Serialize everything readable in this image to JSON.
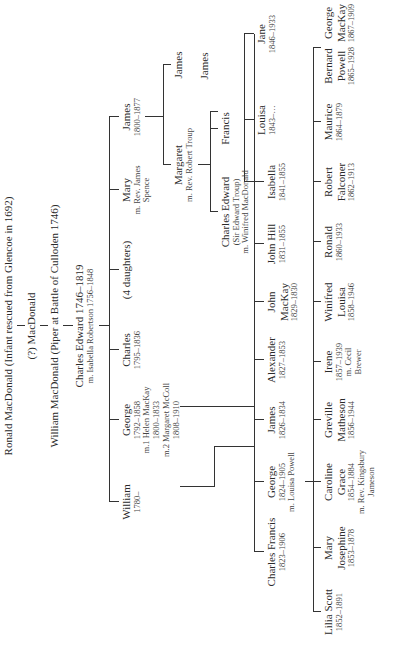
{
  "gen1": [
    {
      "name": "Ronald MacDonald (Infant rescued from Glencoe in 1692)"
    },
    {
      "name": "(?) MacDonald"
    },
    {
      "name": "William MacDonald (Piper at Battle of Culloden 1746)"
    },
    {
      "name": "Charles Edward 1746–1819",
      "spouse": "m. Isabella Robertson 1756–1848"
    }
  ],
  "children_of_charles_edward": [
    {
      "name": "William",
      "dates": "1780–"
    },
    {
      "name": "George",
      "dates": "1792–1858",
      "spouse1": "m.1 Helen MacKay",
      "spouse1_dates": "1800–1833",
      "spouse2": "m.2 Margaret McColl",
      "spouse2_dates": "1808–1910"
    },
    {
      "name": "Charles",
      "dates": "1795–1836"
    },
    {
      "name": "(4 daughters)"
    },
    {
      "name": "Mary",
      "spouse": "m. Rev. James",
      "spouse2": "Spence"
    },
    {
      "name": "James",
      "dates": "1800–1877"
    }
  ],
  "children_of_james": [
    {
      "name": "Margaret",
      "spouse": "m. Rev. Robert Troup"
    },
    {
      "name": "James"
    }
  ],
  "children_of_margaret": [
    {
      "name": "Charles Edward",
      "aka": "(Sir Edward Troup)",
      "spouse": "m. Winifred MacDonald"
    },
    {
      "name": "Francis"
    },
    {
      "name": "James"
    }
  ],
  "children_of_george": [
    {
      "name": "Charles Francis",
      "dates": "1823–1906"
    },
    {
      "name": "George",
      "dates": "1824–1905",
      "spouse": "m. Louisa Powell"
    },
    {
      "name": "James",
      "dates": "1826–1834"
    },
    {
      "name": "Alexander",
      "dates": "1827–1853"
    },
    {
      "name": "John",
      "name2": "MacKay",
      "dates": "1829–1830"
    },
    {
      "name": "John Hill",
      "dates": "1831–1855"
    },
    {
      "name": "Isabella",
      "dates": "1841–1855"
    },
    {
      "name": "Louisa",
      "dates": "1843–…"
    },
    {
      "name": "Jane",
      "dates": "1846–1933"
    }
  ],
  "children_of_george_jr": [
    {
      "name": "Lilia Scott",
      "dates": "1852–1891"
    },
    {
      "name": "Mary",
      "name2": "Josephine",
      "dates": "1853–1878"
    },
    {
      "name": "Caroline",
      "name2": "Grace",
      "dates": "1854–1884",
      "spouse": "m. Rev. Kingsbury",
      "spouse2": "Jameson"
    },
    {
      "name": "Greville",
      "name2": "Matheson",
      "dates": "1856–1944"
    },
    {
      "name": "Irene",
      "dates": "1857–1939",
      "spouse": "m. Cecil",
      "spouse2": "Brewer"
    },
    {
      "name": "Winifred",
      "name2": "Louisa",
      "dates": "1858–1946"
    },
    {
      "name": "Ronald",
      "dates": "1860–1933"
    },
    {
      "name": "Robert",
      "name2": "Falconer",
      "dates": "1862–1913"
    },
    {
      "name": "Maurice",
      "dates": "1864–1879"
    },
    {
      "name": "Bernard",
      "name2": "Powell",
      "dates": "1865–1928"
    },
    {
      "name": "George",
      "name2": "MacKay",
      "dates": "1867–1909"
    }
  ]
}
